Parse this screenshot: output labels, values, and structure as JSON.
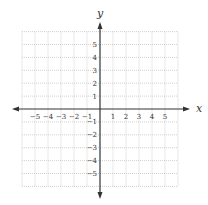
{
  "diagram": {
    "type": "cartesian-coordinate-plane",
    "grid": {
      "x_min": -6,
      "x_max": 6,
      "y_min": -6,
      "y_max": 6,
      "step": 1,
      "line_style": "dotted",
      "grid_color": "#bdbdbd",
      "axis_color": "#333333"
    },
    "axes": {
      "x_label": "x",
      "y_label": "y"
    },
    "x_ticks": [
      {
        "value": -5,
        "label": "−5"
      },
      {
        "value": -4,
        "label": "−4"
      },
      {
        "value": -3,
        "label": "−3"
      },
      {
        "value": -2,
        "label": "−2"
      },
      {
        "value": -1,
        "label": "−1"
      },
      {
        "value": 1,
        "label": "1"
      },
      {
        "value": 2,
        "label": "2"
      },
      {
        "value": 3,
        "label": "3"
      },
      {
        "value": 4,
        "label": "4"
      },
      {
        "value": 5,
        "label": "5"
      }
    ],
    "y_ticks": [
      {
        "value": 5,
        "label": "5"
      },
      {
        "value": 4,
        "label": "4"
      },
      {
        "value": 3,
        "label": "3"
      },
      {
        "value": 2,
        "label": "2"
      },
      {
        "value": 1,
        "label": "1"
      },
      {
        "value": -1,
        "label": "−1"
      },
      {
        "value": -2,
        "label": "−2"
      },
      {
        "value": -3,
        "label": "−3"
      },
      {
        "value": -4,
        "label": "−4"
      },
      {
        "value": -5,
        "label": "−5"
      }
    ]
  }
}
